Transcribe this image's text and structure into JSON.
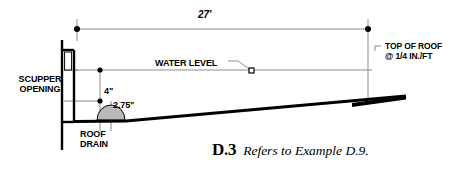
{
  "figure": {
    "title_number": "D.3",
    "title_text": "Refers to Example D.9.",
    "labels": {
      "span_dimension": "27'",
      "scupper_line1": "SCUPPER",
      "scupper_line2": "OPENING",
      "water_level": "WATER LEVEL",
      "roof_drain_line1": "ROOF",
      "roof_drain_line2": "DRAIN",
      "head_dimension": "4\"",
      "drain_dimension": "2.75\"",
      "top_of_roof_line1": "TOP OF ROOF",
      "top_of_roof_line2": "@ 1/4 IN./FT"
    },
    "colors": {
      "line": "#000000",
      "thin_line": "#7a7a7a",
      "drain_fill": "#b8b8b8",
      "background": "#ffffff"
    }
  }
}
